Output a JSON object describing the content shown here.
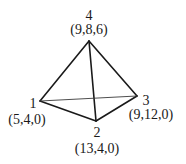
{
  "diagram": {
    "type": "tetrahedron",
    "vertices": [
      {
        "id": "1",
        "number_label": "1",
        "coords_label": "(5,4,0)",
        "px": 40,
        "py": 101
      },
      {
        "id": "2",
        "number_label": "2",
        "coords_label": "(13,4,0)",
        "px": 96,
        "py": 121
      },
      {
        "id": "3",
        "number_label": "3",
        "coords_label": "(9,12,0)",
        "px": 137,
        "py": 96
      },
      {
        "id": "4",
        "number_label": "4",
        "coords_label": "(9,8,6)",
        "px": 89,
        "py": 41
      }
    ],
    "edges": [
      {
        "from": "4",
        "to": "1",
        "style": "solid"
      },
      {
        "from": "4",
        "to": "2",
        "style": "solid"
      },
      {
        "from": "4",
        "to": "3",
        "style": "solid"
      },
      {
        "from": "1",
        "to": "2",
        "style": "solid"
      },
      {
        "from": "2",
        "to": "3",
        "style": "solid"
      },
      {
        "from": "1",
        "to": "3",
        "style": "thin"
      }
    ],
    "line_color": "#1a1a1a"
  }
}
